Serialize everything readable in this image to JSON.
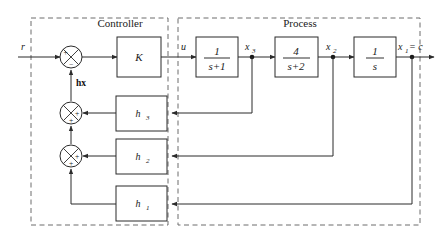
{
  "diagram": {
    "groups": [
      {
        "id": "controller",
        "label": "Controller"
      },
      {
        "id": "process",
        "label": "Process"
      }
    ],
    "signals": {
      "reference": "r",
      "control": "u",
      "state3": "x",
      "state3_sub": "3",
      "state2": "x",
      "state2_sub": "2",
      "output": "x",
      "output_sub": "1",
      "output_eq": "= c",
      "feedback_vector": "hx"
    },
    "blocks": [
      {
        "id": "gain-k",
        "label": "K",
        "type": "gain"
      },
      {
        "id": "tf-1",
        "numerator": "1",
        "denominator": "s+1",
        "type": "transfer-function"
      },
      {
        "id": "tf-2",
        "numerator": "4",
        "denominator": "s+2",
        "type": "transfer-function"
      },
      {
        "id": "tf-3",
        "numerator": "1",
        "denominator": "s",
        "type": "transfer-function"
      },
      {
        "id": "gain-h3",
        "label": "h",
        "sub": "3",
        "type": "feedback-gain"
      },
      {
        "id": "gain-h2",
        "label": "h",
        "sub": "2",
        "type": "feedback-gain"
      },
      {
        "id": "gain-h1",
        "label": "h",
        "sub": "1",
        "type": "feedback-gain"
      }
    ],
    "summing_junctions": [
      {
        "id": "sum-top",
        "signs": [
          {
            "position": "left",
            "sign": "+"
          },
          {
            "position": "bottom",
            "sign": "−"
          }
        ]
      },
      {
        "id": "sum-middle",
        "signs": [
          {
            "position": "right",
            "sign": "+"
          },
          {
            "position": "bottom",
            "sign": "+"
          }
        ]
      },
      {
        "id": "sum-lower",
        "signs": [
          {
            "position": "right",
            "sign": "+"
          },
          {
            "position": "bottom",
            "sign": "+"
          }
        ]
      }
    ],
    "colors": {
      "wire": "#2b2b2b",
      "dashed_boundary": "#6d6d6d",
      "text": "#1a1a1a",
      "background": "#ffffff"
    }
  }
}
